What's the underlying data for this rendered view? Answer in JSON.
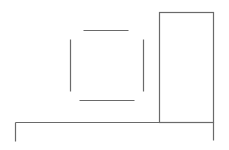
{
  "canvas": {
    "width": 229,
    "height": 150,
    "background": "#ffffff",
    "line_color": "#6a6a6a"
  },
  "drawing": {
    "square_sides": [
      {
        "name": "top",
        "x1": 83,
        "y1": 30,
        "x2": 128,
        "y2": 30
      },
      {
        "name": "left",
        "x1": 70,
        "y1": 39,
        "x2": 70,
        "y2": 91
      },
      {
        "name": "right",
        "x1": 143,
        "y1": 39,
        "x2": 143,
        "y2": 91
      },
      {
        "name": "bottom",
        "x1": 79,
        "y1": 100,
        "x2": 134,
        "y2": 100
      }
    ],
    "tall_rect": {
      "x": 159,
      "y": 12,
      "width": 54,
      "height": 110
    },
    "base_line": {
      "x1": 15,
      "y1": 122,
      "x2": 213,
      "y2": 122
    },
    "base_legs": [
      {
        "name": "left-leg",
        "x1": 15,
        "y1": 122,
        "x2": 15,
        "y2": 141
      },
      {
        "name": "right-leg",
        "x1": 213,
        "y1": 122,
        "x2": 213,
        "y2": 140
      }
    ]
  }
}
